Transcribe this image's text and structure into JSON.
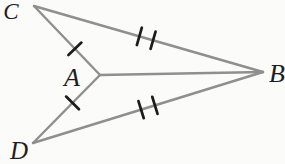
{
  "diagram": {
    "background_color": "#fbfbf9",
    "line_color": "#8f8f8f",
    "line_width": 2.4,
    "tick_color": "#1c1c1c",
    "tick_width": 2.7,
    "tick_half_length": 9,
    "label_color": "#1e1e22",
    "canvas": {
      "width": 285,
      "height": 164
    },
    "points": {
      "C": {
        "x": 34,
        "y": 6
      },
      "A": {
        "x": 100,
        "y": 75
      },
      "B": {
        "x": 263,
        "y": 72
      },
      "D": {
        "x": 33,
        "y": 143
      }
    },
    "segments": [
      {
        "name": "segment-CA",
        "from": "C",
        "to": "A",
        "tick_count": 1,
        "tick_positions": [
          0.62
        ]
      },
      {
        "name": "segment-DA",
        "from": "D",
        "to": "A",
        "tick_count": 1,
        "tick_positions": [
          0.59
        ]
      },
      {
        "name": "segment-CB",
        "from": "C",
        "to": "B",
        "tick_count": 2,
        "tick_positions": [
          0.46,
          0.52
        ]
      },
      {
        "name": "segment-DB",
        "from": "D",
        "to": "B",
        "tick_count": 2,
        "tick_positions": [
          0.47,
          0.53
        ]
      },
      {
        "name": "segment-AB",
        "from": "A",
        "to": "B",
        "tick_count": 0,
        "tick_positions": []
      }
    ],
    "labels": [
      {
        "text": "C",
        "x": 11,
        "y": 11,
        "font_size": 23
      },
      {
        "text": "A",
        "x": 72,
        "y": 77,
        "font_size": 26
      },
      {
        "text": "B",
        "x": 277,
        "y": 73,
        "font_size": 26
      },
      {
        "text": "D",
        "x": 19,
        "y": 150,
        "font_size": 25
      }
    ]
  }
}
